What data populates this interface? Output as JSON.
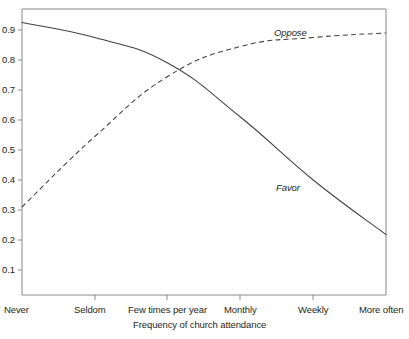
{
  "chart_data": {
    "type": "line",
    "title": "",
    "subtitle": "",
    "xlabel": "Frequency of church attendance",
    "ylabel": "",
    "categories": [
      "Never",
      "Seldom",
      "Few times per year",
      "Monthly",
      "Weekly",
      "More often"
    ],
    "x": [
      0,
      1,
      2,
      3,
      4,
      5
    ],
    "xlim": [
      0,
      5
    ],
    "ylim": [
      0,
      1.0
    ],
    "yticks": [
      0.1,
      0.2,
      0.3,
      0.4,
      0.5,
      0.6,
      0.7,
      0.8,
      0.9
    ],
    "ytick_labels": [
      "0.1",
      "0.2",
      "0.3",
      "0.4",
      "0.5",
      "0.6",
      "0.7",
      "0.8",
      "0.9"
    ],
    "grid": false,
    "legend_position": "inline-annotation",
    "series": [
      {
        "name": "Favor",
        "style": "solid",
        "color": "#404040",
        "values": [
          0.925,
          0.875,
          0.79,
          0.61,
          0.4,
          0.218
        ],
        "label_text": "Favor"
      },
      {
        "name": "Oppose",
        "style": "dashed",
        "color": "#404040",
        "values": [
          0.31,
          0.545,
          0.745,
          0.845,
          0.875,
          0.89
        ],
        "label_text": "Oppose"
      }
    ],
    "annotations": [
      {
        "text": "Oppose",
        "series": "Oppose"
      },
      {
        "text": "Favor",
        "series": "Favor"
      }
    ]
  },
  "axis": {
    "x_title": "Frequency of church attendance",
    "y_tick_labels": [
      "0.9",
      "0.8",
      "0.7",
      "0.6",
      "0.5",
      "0.4",
      "0.3",
      "0.2",
      "0.1"
    ],
    "x_tick_labels": [
      "Never",
      "Seldom",
      "Few times per year",
      "Monthly",
      "Weekly",
      "More often"
    ],
    "axis_color": "#808080"
  },
  "annotations": {
    "oppose_label": "Oppose",
    "favor_label": "Favor"
  }
}
